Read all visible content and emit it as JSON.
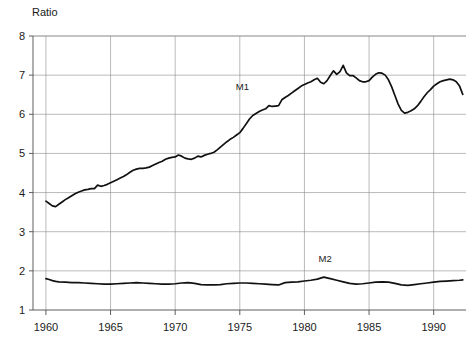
{
  "chart_data": {
    "type": "line",
    "title": "",
    "ylabel": "Ratio",
    "xlabel": "",
    "ylim": [
      1,
      8
    ],
    "xlim": [
      1959,
      1992.5
    ],
    "grid": true,
    "legend_position": "inline-annotation",
    "y_ticks": [
      1,
      2,
      3,
      4,
      5,
      6,
      7,
      8
    ],
    "y_tick_labels": [
      "1",
      "2",
      "3",
      "4",
      "5",
      "6",
      "7",
      "8"
    ],
    "x_ticks": [
      1960,
      1965,
      1970,
      1975,
      1980,
      1985,
      1990
    ],
    "x_tick_labels": [
      "1960",
      "1965",
      "1970",
      "1975",
      "1980",
      "1985",
      "1990"
    ],
    "annotations": [
      {
        "text": "M1",
        "x": 1975.2,
        "y": 6.63
      },
      {
        "text": "M2",
        "x": 1981.6,
        "y": 2.22
      }
    ],
    "series": [
      {
        "name": "M1",
        "x": [
          1960.0,
          1960.25,
          1960.5,
          1960.75,
          1961.0,
          1961.25,
          1961.5,
          1961.75,
          1962.0,
          1962.25,
          1962.5,
          1962.75,
          1963.0,
          1963.25,
          1963.5,
          1963.75,
          1964.0,
          1964.25,
          1964.5,
          1964.75,
          1965.0,
          1965.25,
          1965.5,
          1965.75,
          1966.0,
          1966.25,
          1966.5,
          1966.75,
          1967.0,
          1967.25,
          1967.5,
          1967.75,
          1968.0,
          1968.25,
          1968.5,
          1968.75,
          1969.0,
          1969.25,
          1969.5,
          1969.75,
          1970.0,
          1970.25,
          1970.5,
          1970.75,
          1971.0,
          1971.25,
          1971.5,
          1971.75,
          1972.0,
          1972.25,
          1972.5,
          1972.75,
          1973.0,
          1973.25,
          1973.5,
          1973.75,
          1974.0,
          1974.25,
          1974.5,
          1974.75,
          1975.0,
          1975.25,
          1975.5,
          1975.75,
          1976.0,
          1976.25,
          1976.5,
          1976.75,
          1977.0,
          1977.25,
          1977.5,
          1977.75,
          1978.0,
          1978.25,
          1978.5,
          1978.75,
          1979.0,
          1979.25,
          1979.5,
          1979.75,
          1980.0,
          1980.25,
          1980.5,
          1980.75,
          1981.0,
          1981.25,
          1981.5,
          1981.75,
          1982.0,
          1982.25,
          1982.5,
          1982.75,
          1983.0,
          1983.25,
          1983.5,
          1983.75,
          1984.0,
          1984.25,
          1984.5,
          1984.75,
          1985.0,
          1985.25,
          1985.5,
          1985.75,
          1986.0,
          1986.25,
          1986.5,
          1986.75,
          1987.0,
          1987.25,
          1987.5,
          1987.75,
          1988.0,
          1988.25,
          1988.5,
          1988.75,
          1989.0,
          1989.25,
          1989.5,
          1989.75,
          1990.0,
          1990.25,
          1990.5,
          1990.75,
          1991.0,
          1991.25,
          1991.5,
          1991.75,
          1992.0,
          1992.25
        ],
        "values": [
          3.78,
          3.72,
          3.66,
          3.64,
          3.7,
          3.76,
          3.82,
          3.87,
          3.92,
          3.97,
          4.01,
          4.04,
          4.07,
          4.08,
          4.1,
          4.1,
          4.19,
          4.16,
          4.18,
          4.21,
          4.25,
          4.29,
          4.33,
          4.37,
          4.41,
          4.46,
          4.52,
          4.57,
          4.6,
          4.62,
          4.62,
          4.63,
          4.65,
          4.69,
          4.73,
          4.77,
          4.8,
          4.85,
          4.88,
          4.9,
          4.91,
          4.96,
          4.93,
          4.88,
          4.86,
          4.85,
          4.88,
          4.93,
          4.91,
          4.95,
          4.98,
          5.0,
          5.03,
          5.09,
          5.16,
          5.23,
          5.3,
          5.36,
          5.41,
          5.47,
          5.53,
          5.64,
          5.76,
          5.88,
          5.97,
          6.02,
          6.07,
          6.11,
          6.14,
          6.22,
          6.2,
          6.21,
          6.22,
          6.37,
          6.43,
          6.48,
          6.54,
          6.6,
          6.66,
          6.72,
          6.76,
          6.8,
          6.83,
          6.88,
          6.92,
          6.82,
          6.78,
          6.86,
          6.99,
          7.11,
          7.02,
          7.09,
          7.25,
          7.06,
          6.99,
          6.99,
          6.93,
          6.86,
          6.83,
          6.83,
          6.86,
          6.95,
          7.02,
          7.06,
          7.05,
          7.0,
          6.88,
          6.7,
          6.48,
          6.26,
          6.1,
          6.03,
          6.05,
          6.09,
          6.14,
          6.22,
          6.33,
          6.45,
          6.55,
          6.63,
          6.72,
          6.78,
          6.83,
          6.86,
          6.88,
          6.9,
          6.88,
          6.83,
          6.72,
          6.51
        ]
      },
      {
        "name": "M2",
        "x": [
          1960.0,
          1960.25,
          1960.5,
          1960.75,
          1961.0,
          1961.5,
          1962.0,
          1962.5,
          1963.0,
          1963.5,
          1964.0,
          1964.5,
          1965.0,
          1965.5,
          1966.0,
          1966.5,
          1967.0,
          1967.5,
          1968.0,
          1968.5,
          1969.0,
          1969.5,
          1970.0,
          1970.5,
          1971.0,
          1971.5,
          1972.0,
          1972.5,
          1973.0,
          1973.5,
          1974.0,
          1974.5,
          1975.0,
          1975.5,
          1976.0,
          1976.5,
          1977.0,
          1977.5,
          1978.0,
          1978.5,
          1979.0,
          1979.5,
          1980.0,
          1980.5,
          1981.0,
          1981.5,
          1982.0,
          1982.5,
          1983.0,
          1983.5,
          1984.0,
          1984.5,
          1985.0,
          1985.5,
          1986.0,
          1986.5,
          1987.0,
          1987.5,
          1988.0,
          1988.5,
          1989.0,
          1989.5,
          1990.0,
          1990.5,
          1991.0,
          1991.5,
          1992.0,
          1992.25
        ],
        "values": [
          1.8,
          1.78,
          1.75,
          1.73,
          1.72,
          1.71,
          1.7,
          1.7,
          1.69,
          1.68,
          1.67,
          1.66,
          1.66,
          1.67,
          1.68,
          1.69,
          1.7,
          1.69,
          1.68,
          1.67,
          1.66,
          1.66,
          1.67,
          1.69,
          1.7,
          1.68,
          1.65,
          1.64,
          1.64,
          1.65,
          1.67,
          1.68,
          1.69,
          1.69,
          1.68,
          1.67,
          1.66,
          1.65,
          1.64,
          1.7,
          1.71,
          1.72,
          1.74,
          1.76,
          1.79,
          1.84,
          1.8,
          1.76,
          1.72,
          1.68,
          1.66,
          1.67,
          1.69,
          1.71,
          1.72,
          1.71,
          1.68,
          1.64,
          1.63,
          1.65,
          1.67,
          1.69,
          1.71,
          1.73,
          1.74,
          1.75,
          1.76,
          1.77
        ]
      }
    ]
  }
}
